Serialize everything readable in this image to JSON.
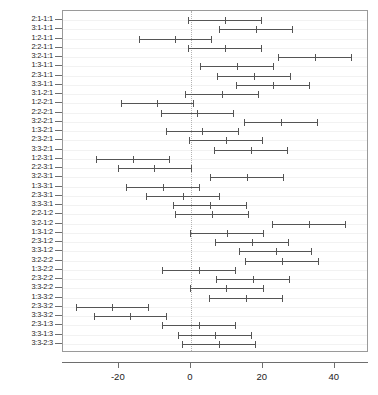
{
  "chart_data": {
    "type": "scatter",
    "title": "",
    "subtitle": "",
    "xlabel": "",
    "ylabel": "",
    "xlim": [
      -35.5,
      49.5
    ],
    "xticks": [
      -20,
      0,
      20,
      40
    ],
    "xtick_labels": [
      "-20",
      "0",
      "20",
      "40"
    ],
    "grid": false,
    "legend": null,
    "reference_line": 0,
    "reference_line_style": "dotted",
    "orientation": "horizontal",
    "columns": [
      "comparison",
      "lower",
      "estimate",
      "upper"
    ],
    "rows": [
      {
        "comparison": "2:1-1:1",
        "lower": -0.8,
        "estimate": 9.5,
        "upper": 19.7
      },
      {
        "comparison": "3:1-1:1",
        "lower": 7.9,
        "estimate": 18.2,
        "upper": 28.4
      },
      {
        "comparison": "1:2-1:1",
        "lower": -14.5,
        "estimate": -4.3,
        "upper": 6.0
      },
      {
        "comparison": "2:2-1:1",
        "lower": -0.8,
        "estimate": 9.5,
        "upper": 19.7
      },
      {
        "comparison": "3:2-1:1",
        "lower": 24.2,
        "estimate": 34.4,
        "upper": 44.7
      },
      {
        "comparison": "1:3-1:1",
        "lower": 2.5,
        "estimate": 12.7,
        "upper": 23.0
      },
      {
        "comparison": "2:3-1:1",
        "lower": 7.4,
        "estimate": 17.6,
        "upper": 27.9
      },
      {
        "comparison": "3:3-1:1",
        "lower": 12.6,
        "estimate": 22.8,
        "upper": 33.1
      },
      {
        "comparison": "3:1-2:1",
        "lower": -1.5,
        "estimate": 8.7,
        "upper": 19.0
      },
      {
        "comparison": "1:2-2:1",
        "lower": -19.5,
        "estimate": -9.3,
        "upper": 1.0
      },
      {
        "comparison": "2:2-2:1",
        "lower": -8.4,
        "estimate": 1.8,
        "upper": 12.1
      },
      {
        "comparison": "3:2-2:1",
        "lower": 14.8,
        "estimate": 25.1,
        "upper": 35.3
      },
      {
        "comparison": "1:3-2:1",
        "lower": -7.0,
        "estimate": 3.2,
        "upper": 13.5
      },
      {
        "comparison": "2:3-2:1",
        "lower": -0.5,
        "estimate": 9.8,
        "upper": 20.0
      },
      {
        "comparison": "3:3-2:1",
        "lower": 6.4,
        "estimate": 16.6,
        "upper": 26.9
      },
      {
        "comparison": "1:2-3:1",
        "lower": -26.3,
        "estimate": -16.0,
        "upper": -5.8
      },
      {
        "comparison": "2:2-3:1",
        "lower": -20.3,
        "estimate": -10.1,
        "upper": 0.2
      },
      {
        "comparison": "3:2-3:1",
        "lower": 5.4,
        "estimate": 15.6,
        "upper": 25.9
      },
      {
        "comparison": "1:3-3:1",
        "lower": -18.0,
        "estimate": -7.8,
        "upper": 2.5
      },
      {
        "comparison": "2:3-3:1",
        "lower": -12.5,
        "estimate": -2.2,
        "upper": 8.0
      },
      {
        "comparison": "3:3-3:1",
        "lower": -5.0,
        "estimate": 5.3,
        "upper": 15.5
      },
      {
        "comparison": "2:2-1:2",
        "lower": -4.3,
        "estimate": 5.9,
        "upper": 16.2
      },
      {
        "comparison": "3:2-1:2",
        "lower": 22.5,
        "estimate": 32.8,
        "upper": 43.0
      },
      {
        "comparison": "1:3-1:2",
        "lower": -0.2,
        "estimate": 10.1,
        "upper": 20.3
      },
      {
        "comparison": "2:3-1:2",
        "lower": 6.7,
        "estimate": 16.9,
        "upper": 27.2
      },
      {
        "comparison": "3:3-1:2",
        "lower": 13.3,
        "estimate": 23.6,
        "upper": 33.8
      },
      {
        "comparison": "3:2-2:2",
        "lower": 15.0,
        "estimate": 25.2,
        "upper": 35.5
      },
      {
        "comparison": "1:3-2:2",
        "lower": -8.0,
        "estimate": 2.3,
        "upper": 12.5
      },
      {
        "comparison": "2:3-2:2",
        "lower": 7.0,
        "estimate": 17.2,
        "upper": 27.5
      },
      {
        "comparison": "3:3-2:2",
        "lower": -0.3,
        "estimate": 9.9,
        "upper": 20.2
      },
      {
        "comparison": "1:3-3:2",
        "lower": 5.0,
        "estimate": 15.3,
        "upper": 25.5
      },
      {
        "comparison": "2:3-3:2",
        "lower": -32.0,
        "estimate": -21.8,
        "upper": -11.5
      },
      {
        "comparison": "3:3-3:2",
        "lower": -27.0,
        "estimate": -16.8,
        "upper": -6.5
      },
      {
        "comparison": "2:3-1:3",
        "lower": -8.0,
        "estimate": 2.3,
        "upper": 12.5
      },
      {
        "comparison": "3:3-1:3",
        "lower": -3.5,
        "estimate": 6.8,
        "upper": 17.0
      },
      {
        "comparison": "3:3-2:3",
        "lower": -2.5,
        "estimate": 7.8,
        "upper": 18.0
      }
    ]
  },
  "axes": {
    "x_tick_labels": [
      "-20",
      "0",
      "20",
      "40"
    ],
    "y_tick_labels": [
      "2:1-1:1",
      "3:1-1:1",
      "1:2-1:1",
      "2:2-1:1",
      "3:2-1:1",
      "1:3-1:1",
      "2:3-1:1",
      "3:3-1:1",
      "3:1-2:1",
      "1:2-2:1",
      "2:2-2:1",
      "3:2-2:1",
      "1:3-2:1",
      "2:3-2:1",
      "3:3-2:1",
      "1:2-3:1",
      "2:2-3:1",
      "3:2-3:1",
      "1:3-3:1",
      "2:3-3:1",
      "3:3-3:1",
      "2:2-1:2",
      "3:2-1:2",
      "1:3-1:2",
      "2:3-1:2",
      "3:3-1:2",
      "3:2-2:2",
      "1:3-2:2",
      "2:3-2:2",
      "3:3-2:2",
      "1:3-3:2",
      "2:3-3:2",
      "3:3-3:2",
      "2:3-1:3",
      "3:3-1:3",
      "3:3-2:3"
    ]
  },
  "style": {
    "segment_color": "#555555",
    "frame_color": "#9a9a9a",
    "reference_line_color": "#b4b4b4",
    "text_color": "#222222",
    "background": "#ffffff"
  }
}
